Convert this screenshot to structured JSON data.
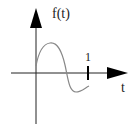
{
  "diagram": {
    "type": "function-plot-sketch",
    "y_axis_label": "f(t)",
    "x_axis_label": "t",
    "tick_label": "1",
    "curve_description": "one period of a sine-like wave starting above origin, peaking, crossing the t-axis, dipping below and rising toward t=1",
    "colors": {
      "axes": "#222222",
      "curve": "#888888",
      "background": "#ffffff"
    }
  }
}
